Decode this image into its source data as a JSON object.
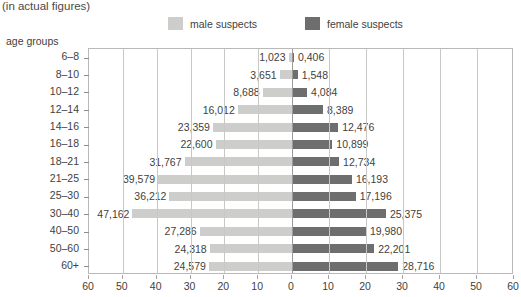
{
  "subtitle": "(in actual figures)",
  "axis_title": "age groups",
  "legend": {
    "male": {
      "label": "male suspects",
      "color": "#cdcdcb",
      "icon": "legend-swatch-icon"
    },
    "female": {
      "label": "female suspects",
      "color": "#6e6e6e",
      "icon": "legend-swatch-icon"
    }
  },
  "chart_data": {
    "type": "bar",
    "subtype": "population-pyramid",
    "title": "",
    "subtitle": "(in actual figures)",
    "xlabel": "",
    "ylabel": "age groups",
    "categories": [
      "6–8",
      "8–10",
      "10–12",
      "12–14",
      "14–16",
      "16–18",
      "18–21",
      "21–25",
      "25–30",
      "30–40",
      "40–50",
      "50–60",
      "60+"
    ],
    "series": [
      {
        "name": "male suspects",
        "side": "left",
        "color": "#cdcdcb",
        "values": [
          1023,
          3651,
          8688,
          16012,
          23359,
          22600,
          31767,
          39579,
          36212,
          47162,
          27286,
          24318,
          24579
        ],
        "labels": [
          "1,023",
          "3,651",
          "8,688",
          "16,012",
          "23,359",
          "22,600",
          "31,767",
          "39,579",
          "36,212",
          "47,162",
          "27,286",
          "24,318",
          "24,579"
        ]
      },
      {
        "name": "female suspects",
        "side": "right",
        "color": "#6e6e6e",
        "values": [
          406,
          1548,
          4084,
          8389,
          12476,
          10899,
          12734,
          16193,
          17196,
          25375,
          19980,
          22201,
          28716
        ],
        "labels": [
          "0,406",
          "1,548",
          "4,084",
          "8,389",
          "12,476",
          "10,899",
          "12,734",
          "16,193",
          "17,196",
          "25,375",
          "19,980",
          "22,201",
          "28,716"
        ]
      }
    ],
    "x_ticks": [
      {
        "label": "60",
        "value": 60000,
        "side": "left"
      },
      {
        "label": "50",
        "value": 50000,
        "side": "left"
      },
      {
        "label": "40",
        "value": 40000,
        "side": "left"
      },
      {
        "label": "30",
        "value": 30000,
        "side": "left"
      },
      {
        "label": "20",
        "value": 20000,
        "side": "left"
      },
      {
        "label": "10",
        "value": 10000,
        "side": "left"
      },
      {
        "label": "0",
        "value": 0,
        "side": "center"
      },
      {
        "label": "10",
        "value": 10000,
        "side": "right"
      },
      {
        "label": "20",
        "value": 20000,
        "side": "right"
      },
      {
        "label": "30",
        "value": 30000,
        "side": "right"
      },
      {
        "label": "40",
        "value": 40000,
        "side": "right"
      },
      {
        "label": "50",
        "value": 50000,
        "side": "right"
      },
      {
        "label": "60",
        "value": 60000,
        "side": "right"
      }
    ],
    "x_unit": "thousands",
    "xlim": [
      -60000,
      60000
    ],
    "grid": true,
    "legend_position": "top"
  }
}
